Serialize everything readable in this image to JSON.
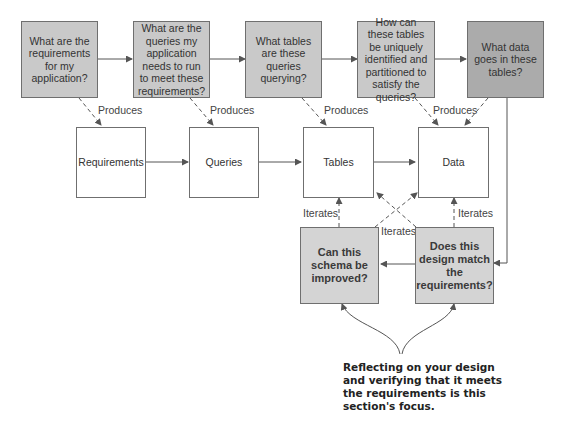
{
  "diagram": {
    "question_boxes": [
      {
        "id": "q1",
        "text": "What are the requirements for my application?"
      },
      {
        "id": "q2",
        "text": "What are the queries my application needs to run to meet these requirements?"
      },
      {
        "id": "q3",
        "text": "What tables are these queries querying?"
      },
      {
        "id": "q4",
        "text": "How can these tables be uniquely identified and partitioned to satisfy the queries?"
      },
      {
        "id": "q5",
        "text": "What data goes in these tables?"
      }
    ],
    "artifact_boxes": [
      {
        "id": "a1",
        "text": "Requirements"
      },
      {
        "id": "a2",
        "text": "Queries"
      },
      {
        "id": "a3",
        "text": "Tables"
      },
      {
        "id": "a4",
        "text": "Data"
      }
    ],
    "review_boxes": [
      {
        "id": "r1",
        "text": "Can this schema be improved?"
      },
      {
        "id": "r2",
        "text": "Does this design match the requirements?"
      }
    ],
    "edge_labels": {
      "produces": "Produces",
      "iterates": "Iterates"
    },
    "annotation": "Reflecting on your design and verifying that it meets the requirements is this section's focus.",
    "colors": {
      "question_fill": "#c9c9c9",
      "question_dark_fill": "#ababab",
      "artifact_fill": "#ffffff",
      "review_fill": "#d4d4d4",
      "stroke": "#6f6f6f"
    }
  }
}
